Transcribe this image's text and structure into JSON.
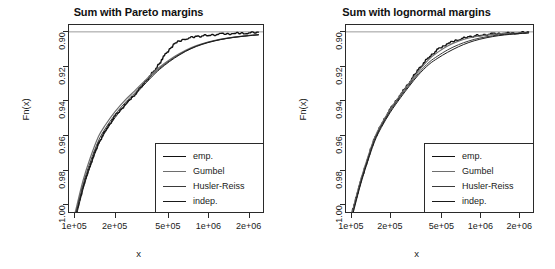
{
  "figure": {
    "background": "#ffffff",
    "panel_count": 2
  },
  "axis": {
    "xlabel": "x",
    "ylabel": "Fn(x)",
    "yticks": [
      "1.00",
      "0.98",
      "0.96",
      "0.94",
      "0.92",
      "0.90"
    ],
    "xticks": [
      "1e+05",
      "2e+05",
      "5e+05",
      "1e+06",
      "2e+06"
    ]
  },
  "legend": {
    "entries": [
      {
        "label": "emp.",
        "color": "#111111",
        "width": 1.4,
        "dash": "none"
      },
      {
        "label": "Gumbel",
        "color": "#6e6e6e",
        "width": 1.2,
        "dash": "none"
      },
      {
        "label": "Husler-Reiss",
        "color": "#3a3a3a",
        "width": 1.0,
        "dash": "none"
      },
      {
        "label": "indep.",
        "color": "#1a1a1a",
        "width": 1.0,
        "dash": "none"
      }
    ]
  },
  "chart_data": [
    {
      "type": "line",
      "title": "Sum with Pareto margins",
      "xlabel": "x",
      "ylabel": "Fn(x)",
      "xscale": "log",
      "xlim": [
        90000,
        2600000
      ],
      "ylim": [
        0.895,
        1.004
      ],
      "xticks": [
        100000,
        200000,
        500000,
        1000000,
        2000000
      ],
      "xticklabels": [
        "1e+05",
        "2e+05",
        "5e+05",
        "1e+06",
        "2e+06"
      ],
      "yticks": [
        0.9,
        0.92,
        0.94,
        0.96,
        0.98,
        1.0
      ],
      "grid": false,
      "legend_position": "bottom-right",
      "reference_line": {
        "y": 1.0,
        "color": "#9a9a9a",
        "width": 1
      },
      "x": [
        100000,
        115000,
        130000,
        150000,
        170000,
        200000,
        240000,
        280000,
        330000,
        400000,
        470000,
        560000,
        680000,
        820000,
        1000000,
        1250000,
        1550000,
        1900000,
        2400000
      ],
      "series": [
        {
          "name": "emp.",
          "style": "step",
          "values": [
            0.891,
            0.909,
            0.922,
            0.9345,
            0.9425,
            0.9505,
            0.9575,
            0.963,
            0.9695,
            0.9775,
            0.9855,
            0.993,
            0.996,
            0.9972,
            0.998,
            0.9986,
            0.999,
            0.9993,
            0.9996
          ]
        },
        {
          "name": "Gumbel",
          "style": "smooth",
          "values": [
            0.8945,
            0.9135,
            0.9265,
            0.939,
            0.946,
            0.9535,
            0.9605,
            0.9655,
            0.971,
            0.9772,
            0.9815,
            0.9856,
            0.9893,
            0.992,
            0.9941,
            0.9958,
            0.9969,
            0.9977,
            0.9984
          ]
        },
        {
          "name": "Husler-Reiss",
          "style": "smooth",
          "values": [
            0.8925,
            0.911,
            0.924,
            0.9365,
            0.944,
            0.9518,
            0.959,
            0.9642,
            0.97,
            0.9764,
            0.9809,
            0.9851,
            0.9889,
            0.9917,
            0.9939,
            0.9956,
            0.9968,
            0.9976,
            0.9983
          ]
        },
        {
          "name": "indep.",
          "style": "smooth",
          "values": [
            0.89,
            0.9085,
            0.9215,
            0.9342,
            0.942,
            0.95,
            0.9575,
            0.963,
            0.969,
            0.9757,
            0.9804,
            0.9847,
            0.9886,
            0.9915,
            0.9937,
            0.9955,
            0.9967,
            0.9975,
            0.9983
          ]
        }
      ]
    },
    {
      "type": "line",
      "title": "Sum with lognormal margins",
      "xlabel": "x",
      "ylabel": "Fn(x)",
      "xscale": "log",
      "xlim": [
        90000,
        2600000
      ],
      "ylim": [
        0.895,
        1.004
      ],
      "xticks": [
        100000,
        200000,
        500000,
        1000000,
        2000000
      ],
      "xticklabels": [
        "1e+05",
        "2e+05",
        "5e+05",
        "1e+06",
        "2e+06"
      ],
      "yticks": [
        0.9,
        0.92,
        0.94,
        0.96,
        0.98,
        1.0
      ],
      "grid": false,
      "legend_position": "bottom-right",
      "reference_line": {
        "y": 1.0,
        "color": "#9a9a9a",
        "width": 1
      },
      "x": [
        100000,
        115000,
        130000,
        150000,
        170000,
        200000,
        240000,
        280000,
        330000,
        400000,
        470000,
        560000,
        680000,
        820000,
        1000000,
        1250000,
        1550000,
        1900000,
        2400000
      ],
      "series": [
        {
          "name": "emp.",
          "style": "step",
          "values": [
            0.893,
            0.91,
            0.923,
            0.937,
            0.9455,
            0.9545,
            0.963,
            0.97,
            0.9775,
            0.985,
            0.9895,
            0.993,
            0.9955,
            0.997,
            0.998,
            0.9987,
            0.9991,
            0.9994,
            0.9997
          ]
        },
        {
          "name": "Gumbel",
          "style": "smooth",
          "values": [
            0.894,
            0.9115,
            0.9245,
            0.938,
            0.9462,
            0.955,
            0.9634,
            0.97,
            0.977,
            0.984,
            0.9882,
            0.9918,
            0.9946,
            0.9964,
            0.9976,
            0.9985,
            0.999,
            0.9993,
            0.9996
          ]
        },
        {
          "name": "Husler-Reiss",
          "style": "smooth",
          "values": [
            0.8925,
            0.91,
            0.9232,
            0.9368,
            0.9452,
            0.954,
            0.9624,
            0.969,
            0.9757,
            0.9822,
            0.986,
            0.9895,
            0.9925,
            0.9947,
            0.9964,
            0.9977,
            0.9985,
            0.999,
            0.9995
          ]
        },
        {
          "name": "indep.",
          "style": "smooth",
          "values": [
            0.8915,
            0.909,
            0.9222,
            0.9358,
            0.9443,
            0.9532,
            0.9616,
            0.9682,
            0.9748,
            0.981,
            0.9847,
            0.9881,
            0.9913,
            0.9938,
            0.9957,
            0.9972,
            0.9982,
            0.9988,
            0.9994
          ]
        }
      ]
    }
  ]
}
